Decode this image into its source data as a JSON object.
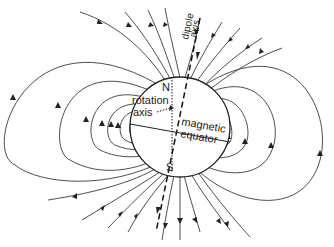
{
  "diagram": {
    "labels": {
      "north": "N",
      "south": "S",
      "rotation_axis_line1": "rotation",
      "rotation_axis_line2": "axis",
      "magnetic_equator_line1": "magnetic",
      "magnetic_equator_line2": "equator",
      "dipole_axis_line1": "dipole",
      "dipole_axis_line2": "axis"
    },
    "colors": {
      "line": "#3a3a3a",
      "background": "#ffffff"
    }
  }
}
